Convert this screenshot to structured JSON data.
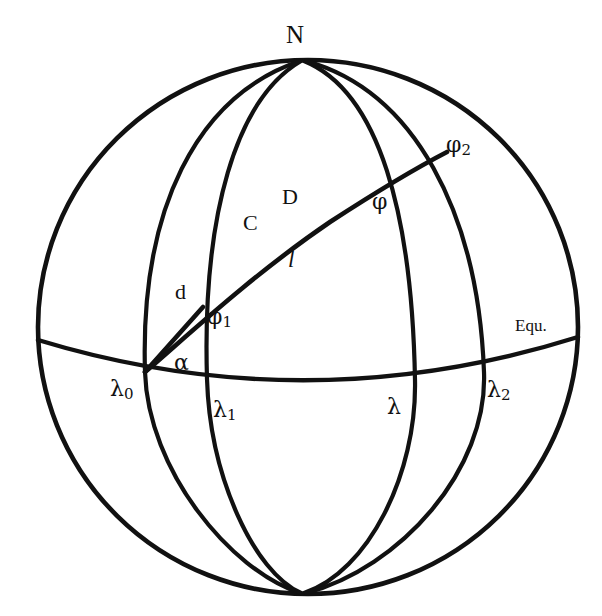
{
  "figure": {
    "stroke_color": "#111111",
    "background_color": "#ffffff",
    "sphere": {
      "center_x": 308,
      "center_y": 327,
      "radius_x": 270,
      "radius_y": 267
    }
  },
  "labels": [
    {
      "id": "north-pole",
      "text": "N",
      "sub": "",
      "x": 286,
      "y": 22,
      "style": "lbl-pole"
    },
    {
      "id": "phi-2",
      "text": "φ",
      "sub": "2",
      "x": 446,
      "y": 134,
      "style": "lbl-greek"
    },
    {
      "id": "phi",
      "text": "φ",
      "sub": "",
      "x": 372,
      "y": 191,
      "style": "lbl-greek"
    },
    {
      "id": "point-d-upper",
      "text": "D",
      "sub": "",
      "x": 282,
      "y": 186,
      "style": "lbl-roman"
    },
    {
      "id": "point-c",
      "text": "C",
      "sub": "",
      "x": 243,
      "y": 212,
      "style": "lbl-roman"
    },
    {
      "id": "arc-length-l",
      "text": "l",
      "sub": "",
      "x": 288,
      "y": 248,
      "style": "lbl-ital"
    },
    {
      "id": "distance-d",
      "text": "d",
      "sub": "",
      "x": 175,
      "y": 281,
      "style": "lbl-roman"
    },
    {
      "id": "phi-1",
      "text": "φ",
      "sub": "1",
      "x": 207,
      "y": 306,
      "style": "lbl-greek"
    },
    {
      "id": "equator-label",
      "text": "Equ.",
      "sub": "",
      "x": 515,
      "y": 317,
      "style": "lbl-equ"
    },
    {
      "id": "azimuth-alpha",
      "text": "α",
      "sub": "",
      "x": 174,
      "y": 352,
      "style": "lbl-greek"
    },
    {
      "id": "lambda-0",
      "text": "λ",
      "sub": "0",
      "x": 110,
      "y": 378,
      "style": "lbl-greek"
    },
    {
      "id": "lambda-1",
      "text": "λ",
      "sub": "1",
      "x": 213,
      "y": 399,
      "style": "lbl-greek"
    },
    {
      "id": "lambda",
      "text": "λ",
      "sub": "",
      "x": 387,
      "y": 396,
      "style": "lbl-greek"
    },
    {
      "id": "lambda-2",
      "text": "λ",
      "sub": "2",
      "x": 487,
      "y": 379,
      "style": "lbl-greek"
    }
  ],
  "curves": {
    "outline": "M 308,60 A 270,267 0 0 1 308,594 A 270,267 0 0 1 308,60 Z",
    "equator": "M 38,340 Q 308,422 578,337",
    "meridians": [
      {
        "id": "meridian-lambda-0",
        "path": "M 300,61 C 196,96 140,210 145,372 C 148,470 230,570 300,593"
      },
      {
        "id": "meridian-lambda-1",
        "path": "M 301,61 C 236,99 202,215 207,379 C 210,477 254,572 301,593"
      },
      {
        "id": "meridian-lambda",
        "path": "M 304,61 C 380,92 412,216 415,380 C 417,474 368,572 304,593"
      },
      {
        "id": "meridian-lambda-2",
        "path": "M 306,61 C 414,91 478,212 484,372 C 488,470 400,568 306,593"
      }
    ],
    "rhumb_line": "M 145,372 C 186,337 252,275 330,222 C 370,196 418,167 447,152",
    "chord_segment": "M 145,372 L 203,307"
  },
  "nodes": [
    {
      "id": "node-lambda-0-equator",
      "x": 145,
      "y": 372
    },
    {
      "id": "node-phi-1",
      "x": 203,
      "y": 307
    },
    {
      "id": "node-phi",
      "x": 399,
      "y": 179
    },
    {
      "id": "node-phi-2",
      "x": 447,
      "y": 152
    }
  ]
}
